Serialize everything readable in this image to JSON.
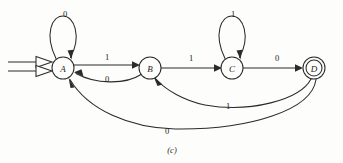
{
  "figure": {
    "caption": "(c)",
    "type": "finite-state-machine-diagram",
    "background_color": "#fdfdfb",
    "ink_color": "#2b2b2b"
  },
  "states": [
    {
      "id": "A",
      "label": "A",
      "cx": 63,
      "cy": 68,
      "r": 11,
      "accepting": false,
      "is_start": true
    },
    {
      "id": "B",
      "label": "B",
      "cx": 150,
      "cy": 68,
      "r": 11,
      "accepting": false,
      "is_start": false
    },
    {
      "id": "C",
      "label": "C",
      "cx": 232,
      "cy": 68,
      "r": 11,
      "accepting": false,
      "is_start": false
    },
    {
      "id": "D",
      "label": "D",
      "cx": 314,
      "cy": 68,
      "r": 11,
      "accepting": true,
      "is_start": false
    }
  ],
  "transitions": [
    {
      "from": "A",
      "to": "A",
      "label": "0",
      "kind": "self-loop",
      "label_x": 65,
      "label_y": 14
    },
    {
      "from": "A",
      "to": "B",
      "label": "1",
      "kind": "straight",
      "label_x": 107,
      "label_y": 57
    },
    {
      "from": "B",
      "to": "A",
      "label": "0",
      "kind": "curve",
      "label_x": 107,
      "label_y": 79
    },
    {
      "from": "B",
      "to": "C",
      "label": "1",
      "kind": "straight",
      "label_x": 191,
      "label_y": 58
    },
    {
      "from": "C",
      "to": "C",
      "label": "1",
      "kind": "self-loop",
      "label_x": 233,
      "label_y": 14
    },
    {
      "from": "C",
      "to": "D",
      "label": "0",
      "kind": "straight",
      "label_x": 277,
      "label_y": 58
    },
    {
      "from": "D",
      "to": "B",
      "label": "1",
      "kind": "long-curve",
      "label_x": 228,
      "label_y": 106
    },
    {
      "from": "D",
      "to": "A",
      "label": "0",
      "kind": "long-curve",
      "label_x": 167,
      "label_y": 131
    }
  ],
  "start_marker": {
    "name": "start-double-arrow",
    "line1_y": 62,
    "line2_y": 71,
    "x_start": 8,
    "x_end": 52
  }
}
